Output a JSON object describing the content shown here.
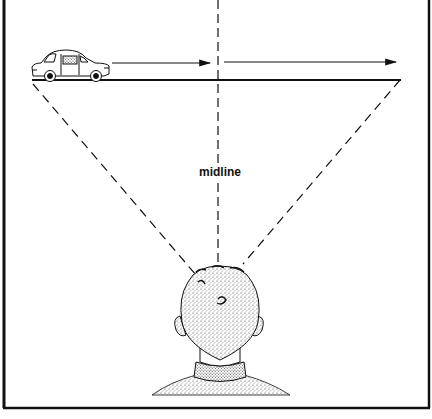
{
  "diagram": {
    "midline_label": "midline",
    "elements": {
      "car": "car-illustration",
      "road": "horizontal-road-line",
      "arrows": [
        "motion-arrow-left",
        "motion-arrow-right"
      ],
      "observer": "observer-head-back-view",
      "lines": [
        "left-sightline-dashed",
        "midline-dashed",
        "right-sightline-dashed"
      ]
    },
    "colors": {
      "ink": "#111111",
      "background": "#ffffff"
    }
  }
}
